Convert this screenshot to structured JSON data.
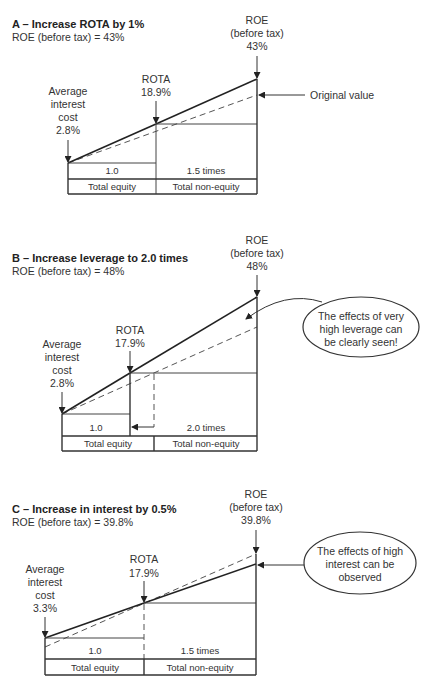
{
  "panels": [
    {
      "id": "A",
      "title": "A – Increase ROTA by 1%",
      "subtitle": "ROE (before tax) = 43%",
      "interest_label": [
        "Average",
        "interest",
        "cost",
        "2.8%"
      ],
      "rota_label": [
        "ROTA",
        "18.9%"
      ],
      "roe_label": [
        "ROE",
        "(before tax)",
        "43%"
      ],
      "annotation": "Original value",
      "table": {
        "row1": [
          "1.0",
          "1.5 times"
        ],
        "row2": [
          "Total equity",
          "Total non-equity"
        ]
      }
    },
    {
      "id": "B",
      "title": "B – Increase leverage to 2.0 times",
      "subtitle": "ROE (before tax) = 48%",
      "interest_label": [
        "Average",
        "interest",
        "cost",
        "2.8%"
      ],
      "rota_label": [
        "ROTA",
        "17.9%"
      ],
      "roe_label": [
        "ROE",
        "(before tax)",
        "48%"
      ],
      "callout": [
        "The effects of very",
        "high leverage can",
        "be clearly seen!"
      ],
      "table": {
        "row1": [
          "1.0",
          "2.0 times"
        ],
        "row2": [
          "Total equity",
          "Total non-equity"
        ]
      }
    },
    {
      "id": "C",
      "title": "C – Increase in interest by 0.5%",
      "subtitle": "ROE (before tax) = 39.8%",
      "interest_label": [
        "Average",
        "interest",
        "cost",
        "3.3%"
      ],
      "rota_label": [
        "ROTA",
        "17.9%"
      ],
      "roe_label": [
        "ROE",
        "(before tax)",
        "39.8%"
      ],
      "callout": [
        "The effects of high",
        "interest can be",
        "observed"
      ],
      "table": {
        "row1": [
          "1.0",
          "1.5 times"
        ],
        "row2": [
          "Total equity",
          "Total non-equity"
        ]
      }
    }
  ],
  "colors": {
    "line": "#222222",
    "dashed": "#555555",
    "text": "#333333",
    "background": "#ffffff"
  }
}
